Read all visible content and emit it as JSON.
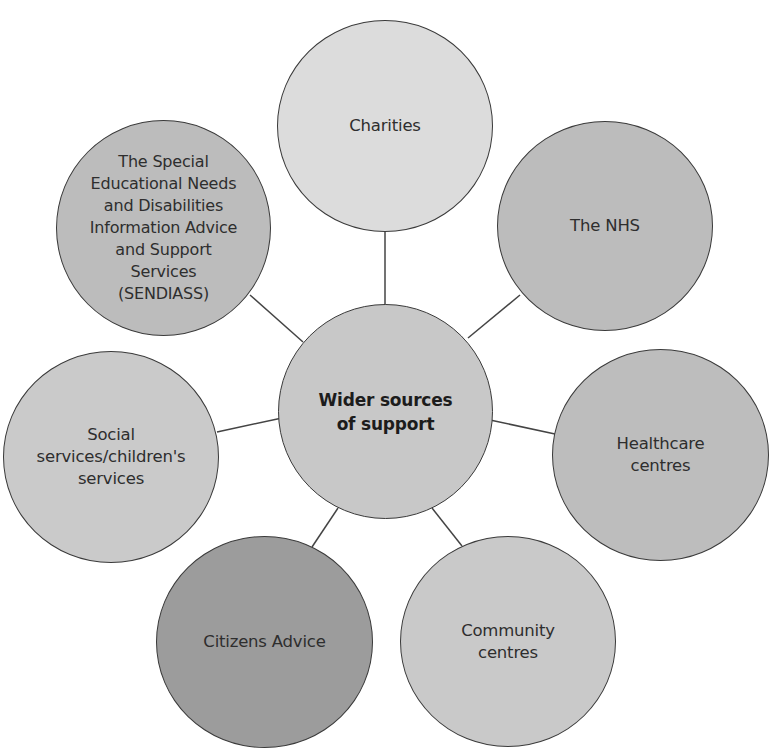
{
  "diagram": {
    "center": {
      "label": "Wider sources\nof support",
      "fill": "#c8c8c8"
    },
    "nodes": [
      {
        "id": "charities",
        "label": "Charities",
        "fill": "#dcdcdc"
      },
      {
        "id": "nhs",
        "label": "The NHS",
        "fill": "#bcbcbc"
      },
      {
        "id": "healthcare",
        "label": "Healthcare\ncentres",
        "fill": "#bdbdbd"
      },
      {
        "id": "community",
        "label": "Community\ncentres",
        "fill": "#c9c9c9"
      },
      {
        "id": "citizens",
        "label": "Citizens Advice",
        "fill": "#9c9c9c"
      },
      {
        "id": "social",
        "label": "Social\nservices/children's\nservices",
        "fill": "#cacaca"
      },
      {
        "id": "sendiass",
        "label": "The Special\nEducational Needs\nand Disabilities\nInformation Advice\nand Support\nServices\n(SENDIASS)",
        "fill": "#bcbcbc"
      }
    ],
    "line_color": "#444444",
    "stroke_color": "#3a3a3a"
  }
}
